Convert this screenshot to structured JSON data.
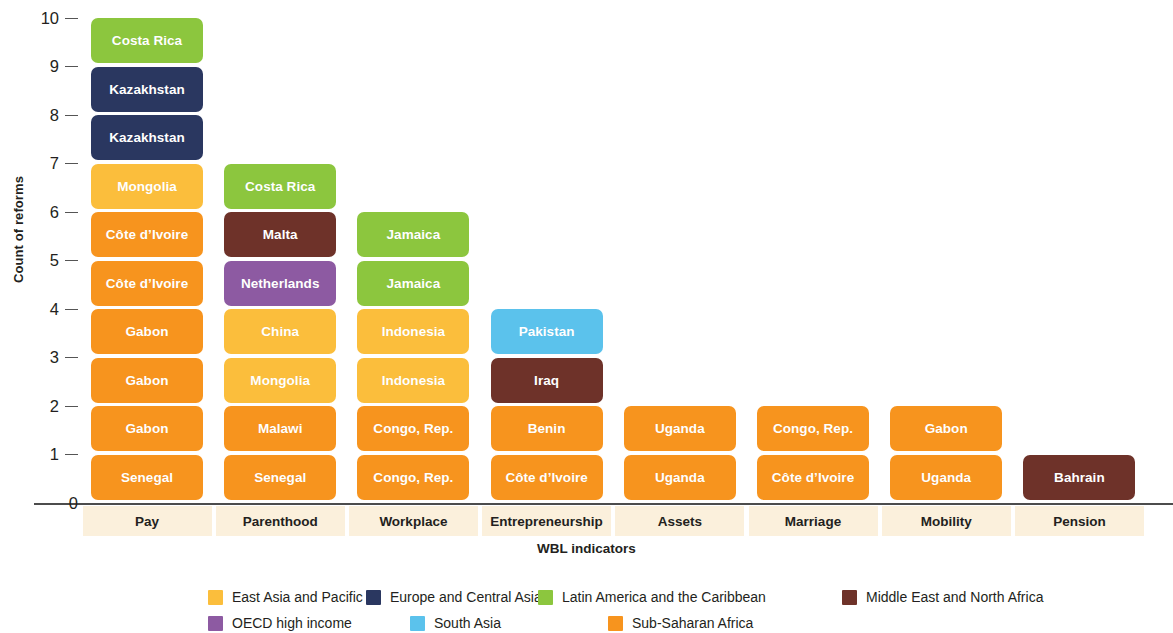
{
  "chart_data": {
    "type": "bar",
    "subtype": "stacked-bar-labeled-segments",
    "title": "",
    "xlabel": "WBL indicators",
    "ylabel": "Count of reforms",
    "ylim": [
      0,
      10
    ],
    "ytick_labels": [
      "0",
      "1",
      "2",
      "3",
      "4",
      "5",
      "6",
      "7",
      "8",
      "9",
      "10"
    ],
    "grid": false,
    "legend_position": "bottom",
    "categories": [
      "Pay",
      "Parenthood",
      "Workplace",
      "Entrepreneurship",
      "Assets",
      "Marriage",
      "Mobility",
      "Pension"
    ],
    "values": [
      10,
      7,
      6,
      4,
      2,
      2,
      2,
      1
    ],
    "series": [
      {
        "name": "East Asia and Pacific",
        "color": "#fbbe3c",
        "values": [
          1,
          2,
          2,
          0,
          0,
          0,
          0,
          0
        ]
      },
      {
        "name": "Europe and Central Asia",
        "color": "#2a3760",
        "values": [
          2,
          0,
          0,
          0,
          0,
          0,
          0,
          0
        ]
      },
      {
        "name": "Latin America and the Caribbean",
        "color": "#8cc63e",
        "values": [
          1,
          1,
          2,
          0,
          0,
          0,
          0,
          0
        ]
      },
      {
        "name": "Middle East and North Africa",
        "color": "#6e3229",
        "values": [
          0,
          1,
          0,
          1,
          0,
          0,
          0,
          1
        ]
      },
      {
        "name": "OECD high income",
        "color": "#8d5aa2",
        "values": [
          0,
          1,
          0,
          0,
          0,
          0,
          0,
          0
        ]
      },
      {
        "name": "South Asia",
        "color": "#5bc2ec",
        "values": [
          0,
          0,
          0,
          1,
          0,
          0,
          0,
          0
        ]
      },
      {
        "name": "Sub-Saharan Africa",
        "color": "#f7941e",
        "values": [
          6,
          2,
          2,
          2,
          2,
          2,
          2,
          0
        ]
      }
    ],
    "stacks": [
      {
        "category": "Pay",
        "total": 10,
        "segments": [
          {
            "label": "Senegal",
            "value": 1,
            "region": "Sub-Saharan Africa",
            "color": "#f7941e"
          },
          {
            "label": "Gabon",
            "value": 1,
            "region": "Sub-Saharan Africa",
            "color": "#f7941e"
          },
          {
            "label": "Gabon",
            "value": 1,
            "region": "Sub-Saharan Africa",
            "color": "#f7941e"
          },
          {
            "label": "Gabon",
            "value": 1,
            "region": "Sub-Saharan Africa",
            "color": "#f7941e"
          },
          {
            "label": "Côte d’Ivoire",
            "value": 1,
            "region": "Sub-Saharan Africa",
            "color": "#f7941e"
          },
          {
            "label": "Côte d’Ivoire",
            "value": 1,
            "region": "Sub-Saharan Africa",
            "color": "#f7941e"
          },
          {
            "label": "Mongolia",
            "value": 1,
            "region": "East Asia and Pacific",
            "color": "#fbbe3c"
          },
          {
            "label": "Kazakhstan",
            "value": 1,
            "region": "Europe and Central Asia",
            "color": "#2a3760"
          },
          {
            "label": "Kazakhstan",
            "value": 1,
            "region": "Europe and Central Asia",
            "color": "#2a3760"
          },
          {
            "label": "Costa Rica",
            "value": 1,
            "region": "Latin America and the Caribbean",
            "color": "#8cc63e"
          }
        ]
      },
      {
        "category": "Parenthood",
        "total": 7,
        "segments": [
          {
            "label": "Senegal",
            "value": 1,
            "region": "Sub-Saharan Africa",
            "color": "#f7941e"
          },
          {
            "label": "Malawi",
            "value": 1,
            "region": "Sub-Saharan Africa",
            "color": "#f7941e"
          },
          {
            "label": "Mongolia",
            "value": 1,
            "region": "East Asia and Pacific",
            "color": "#fbbe3c"
          },
          {
            "label": "China",
            "value": 1,
            "region": "East Asia and Pacific",
            "color": "#fbbe3c"
          },
          {
            "label": "Netherlands",
            "value": 1,
            "region": "OECD high income",
            "color": "#8d5aa2"
          },
          {
            "label": "Malta",
            "value": 1,
            "region": "Middle East and North Africa",
            "color": "#6e3229"
          },
          {
            "label": "Costa Rica",
            "value": 1,
            "region": "Latin America and the Caribbean",
            "color": "#8cc63e"
          }
        ]
      },
      {
        "category": "Workplace",
        "total": 6,
        "segments": [
          {
            "label": "Congo, Rep.",
            "value": 1,
            "region": "Sub-Saharan Africa",
            "color": "#f7941e"
          },
          {
            "label": "Congo, Rep.",
            "value": 1,
            "region": "Sub-Saharan Africa",
            "color": "#f7941e"
          },
          {
            "label": "Indonesia",
            "value": 1,
            "region": "East Asia and Pacific",
            "color": "#fbbe3c"
          },
          {
            "label": "Indonesia",
            "value": 1,
            "region": "East Asia and Pacific",
            "color": "#fbbe3c"
          },
          {
            "label": "Jamaica",
            "value": 1,
            "region": "Latin America and the Caribbean",
            "color": "#8cc63e"
          },
          {
            "label": "Jamaica",
            "value": 1,
            "region": "Latin America and the Caribbean",
            "color": "#8cc63e"
          }
        ]
      },
      {
        "category": "Entrepreneurship",
        "total": 4,
        "segments": [
          {
            "label": "Côte d’Ivoire",
            "value": 1,
            "region": "Sub-Saharan Africa",
            "color": "#f7941e"
          },
          {
            "label": "Benin",
            "value": 1,
            "region": "Sub-Saharan Africa",
            "color": "#f7941e"
          },
          {
            "label": "Iraq",
            "value": 1,
            "region": "Middle East and North Africa",
            "color": "#6e3229"
          },
          {
            "label": "Pakistan",
            "value": 1,
            "region": "South Asia",
            "color": "#5bc2ec"
          }
        ]
      },
      {
        "category": "Assets",
        "total": 2,
        "segments": [
          {
            "label": "Uganda",
            "value": 1,
            "region": "Sub-Saharan Africa",
            "color": "#f7941e"
          },
          {
            "label": "Uganda",
            "value": 1,
            "region": "Sub-Saharan Africa",
            "color": "#f7941e"
          }
        ]
      },
      {
        "category": "Marriage",
        "total": 2,
        "segments": [
          {
            "label": "Côte d’Ivoire",
            "value": 1,
            "region": "Sub-Saharan Africa",
            "color": "#f7941e"
          },
          {
            "label": "Congo, Rep.",
            "value": 1,
            "region": "Sub-Saharan Africa",
            "color": "#f7941e"
          }
        ]
      },
      {
        "category": "Mobility",
        "total": 2,
        "segments": [
          {
            "label": "Uganda",
            "value": 1,
            "region": "Sub-Saharan Africa",
            "color": "#f7941e"
          },
          {
            "label": "Gabon",
            "value": 1,
            "region": "Sub-Saharan Africa",
            "color": "#f7941e"
          }
        ]
      },
      {
        "category": "Pension",
        "total": 1,
        "segments": [
          {
            "label": "Bahrain",
            "value": 1,
            "region": "Middle East and North Africa",
            "color": "#6e3229"
          }
        ]
      }
    ]
  },
  "legend": {
    "rows": [
      [
        {
          "label": "East Asia and Pacific",
          "color": "#fbbe3c"
        },
        {
          "label": "Europe and Central Asia",
          "color": "#2a3760"
        },
        {
          "label": "Latin America and the Caribbean",
          "color": "#8cc63e"
        },
        {
          "label": "Middle East and North Africa",
          "color": "#6e3229"
        }
      ],
      [
        {
          "label": "OECD high income",
          "color": "#8d5aa2"
        },
        {
          "label": "South Asia",
          "color": "#5bc2ec"
        },
        {
          "label": "Sub-Saharan Africa",
          "color": "#f7941e"
        }
      ]
    ]
  },
  "colors": {
    "category_label_background": "#fbf0dc",
    "axis_line": "#4c4c4c",
    "text": "#231f20",
    "background": "#ffffff"
  }
}
